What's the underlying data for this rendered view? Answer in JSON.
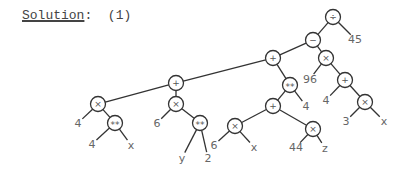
{
  "heading": {
    "label": "Solution",
    "colon": ":",
    "number": "(1)"
  },
  "tree": {
    "nodes": [
      {
        "id": "n1",
        "label": "÷",
        "x": 333,
        "y": 17,
        "type": "op"
      },
      {
        "id": "n2",
        "label": "−",
        "x": 313,
        "y": 40,
        "type": "op"
      },
      {
        "id": "n3",
        "label": "45",
        "x": 355,
        "y": 39,
        "type": "leaf"
      },
      {
        "id": "n4",
        "label": "+",
        "x": 273,
        "y": 58,
        "type": "op"
      },
      {
        "id": "n5",
        "label": "×",
        "x": 326,
        "y": 58,
        "type": "op"
      },
      {
        "id": "n6",
        "label": "96",
        "x": 310,
        "y": 79,
        "type": "leaf"
      },
      {
        "id": "n7",
        "label": "+",
        "x": 345,
        "y": 80,
        "type": "op"
      },
      {
        "id": "n8",
        "label": "4",
        "x": 326,
        "y": 100,
        "type": "leaf"
      },
      {
        "id": "n9",
        "label": "×",
        "x": 365,
        "y": 102,
        "type": "op"
      },
      {
        "id": "n10",
        "label": "3",
        "x": 346,
        "y": 121,
        "type": "leaf"
      },
      {
        "id": "n11",
        "label": "x",
        "x": 384,
        "y": 121,
        "type": "leaf"
      },
      {
        "id": "n12",
        "label": "**",
        "x": 290,
        "y": 85,
        "type": "op"
      },
      {
        "id": "n13",
        "label": "4",
        "x": 306,
        "y": 106,
        "type": "leaf"
      },
      {
        "id": "n14",
        "label": "+",
        "x": 273,
        "y": 106,
        "type": "op"
      },
      {
        "id": "n15",
        "label": "×",
        "x": 235,
        "y": 126,
        "type": "op"
      },
      {
        "id": "n16",
        "label": "6",
        "x": 214,
        "y": 145,
        "type": "leaf"
      },
      {
        "id": "n17",
        "label": "x",
        "x": 254,
        "y": 147,
        "type": "leaf"
      },
      {
        "id": "n18",
        "label": "×",
        "x": 313,
        "y": 129,
        "type": "op"
      },
      {
        "id": "n19",
        "label": "44",
        "x": 296,
        "y": 147,
        "type": "leaf"
      },
      {
        "id": "n20",
        "label": "z",
        "x": 325,
        "y": 148,
        "type": "leaf"
      },
      {
        "id": "n21",
        "label": "+",
        "x": 176,
        "y": 83,
        "type": "op"
      },
      {
        "id": "n22",
        "label": "×",
        "x": 98,
        "y": 104,
        "type": "op"
      },
      {
        "id": "n23",
        "label": "4",
        "x": 78,
        "y": 123,
        "type": "leaf"
      },
      {
        "id": "n24",
        "label": "**",
        "x": 115,
        "y": 123,
        "type": "op"
      },
      {
        "id": "n25",
        "label": "4",
        "x": 92,
        "y": 144,
        "type": "leaf"
      },
      {
        "id": "n26",
        "label": "x",
        "x": 131,
        "y": 145,
        "type": "leaf"
      },
      {
        "id": "n27",
        "label": "×",
        "x": 176,
        "y": 104,
        "type": "op"
      },
      {
        "id": "n28",
        "label": "6",
        "x": 157,
        "y": 123,
        "type": "leaf"
      },
      {
        "id": "n29",
        "label": "**",
        "x": 200,
        "y": 123,
        "type": "op"
      },
      {
        "id": "n30",
        "label": "y",
        "x": 182,
        "y": 158,
        "type": "leaf"
      },
      {
        "id": "n31",
        "label": "2",
        "x": 208,
        "y": 158,
        "type": "leaf"
      }
    ],
    "edges": [
      [
        "n1",
        "n2"
      ],
      [
        "n1",
        "n3"
      ],
      [
        "n2",
        "n4"
      ],
      [
        "n2",
        "n5"
      ],
      [
        "n5",
        "n6"
      ],
      [
        "n5",
        "n7"
      ],
      [
        "n7",
        "n8"
      ],
      [
        "n7",
        "n9"
      ],
      [
        "n9",
        "n10"
      ],
      [
        "n9",
        "n11"
      ],
      [
        "n4",
        "n21"
      ],
      [
        "n4",
        "n12"
      ],
      [
        "n12",
        "n14"
      ],
      [
        "n12",
        "n13"
      ],
      [
        "n14",
        "n15"
      ],
      [
        "n14",
        "n18"
      ],
      [
        "n15",
        "n16"
      ],
      [
        "n15",
        "n17"
      ],
      [
        "n18",
        "n19"
      ],
      [
        "n18",
        "n20"
      ],
      [
        "n21",
        "n22"
      ],
      [
        "n21",
        "n27"
      ],
      [
        "n22",
        "n23"
      ],
      [
        "n22",
        "n24"
      ],
      [
        "n24",
        "n25"
      ],
      [
        "n24",
        "n26"
      ],
      [
        "n27",
        "n28"
      ],
      [
        "n27",
        "n29"
      ],
      [
        "n29",
        "n30"
      ],
      [
        "n29",
        "n31"
      ]
    ]
  }
}
